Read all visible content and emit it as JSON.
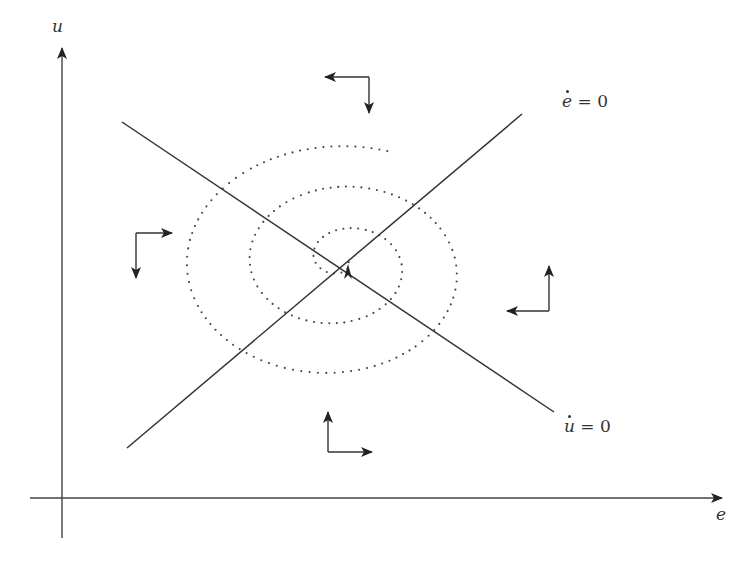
{
  "diagram": {
    "type": "phase-diagram",
    "colors": {
      "line": "#333333",
      "axis": "#444444",
      "dots": "#444444",
      "background": "#ffffff"
    },
    "axes": {
      "x": {
        "label": "e",
        "from": [
          30,
          498
        ],
        "to": [
          722,
          498
        ]
      },
      "y": {
        "label": "u",
        "from": [
          62,
          538
        ],
        "to": [
          62,
          48
        ]
      }
    },
    "nullclines": [
      {
        "id": "e-dot-zero",
        "label_var": "e",
        "label_rest": " = ",
        "label_value": "0",
        "from": [
          127,
          448
        ],
        "to": [
          522,
          114
        ]
      },
      {
        "id": "u-dot-zero",
        "label_var": "u",
        "label_rest": " = ",
        "label_value": "0",
        "from": [
          122,
          122
        ],
        "to": [
          554,
          412
        ]
      }
    ],
    "equilibrium": [
      348,
      262
    ],
    "arrow_clusters": [
      {
        "id": "top",
        "corner": [
          369,
          77
        ],
        "h_to": [
          325,
          77
        ],
        "v_to": [
          369,
          113
        ]
      },
      {
        "id": "left",
        "corner": [
          136,
          233
        ],
        "h_to": [
          172,
          233
        ],
        "v_to": [
          136,
          278
        ]
      },
      {
        "id": "right",
        "corner": [
          549,
          311
        ],
        "h_to": [
          507,
          311
        ],
        "v_to": [
          549,
          266
        ]
      },
      {
        "id": "bottom",
        "corner": [
          328,
          452
        ],
        "h_to": [
          372,
          452
        ],
        "v_to": [
          328,
          412
        ]
      }
    ]
  }
}
